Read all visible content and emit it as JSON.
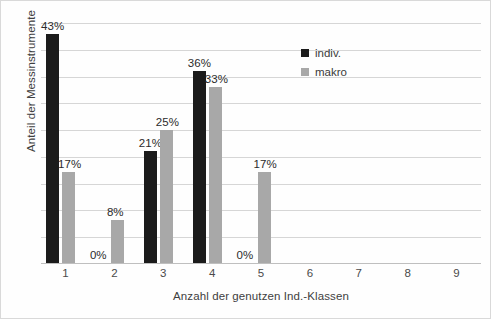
{
  "chart_data": {
    "type": "bar",
    "title": "",
    "xlabel": "Anzahl der genutzen Ind.-Klassen",
    "ylabel": "Anteil der Messinstrumente",
    "categories": [
      "1",
      "2",
      "3",
      "4",
      "5",
      "6",
      "7",
      "8",
      "9"
    ],
    "series": [
      {
        "name": "indiv.",
        "color": "#1b1b1b",
        "values": [
          43,
          0,
          21,
          36,
          0,
          null,
          null,
          null,
          null
        ],
        "labels": [
          "43%",
          "0%",
          "21%",
          "36%",
          "0%",
          "",
          "",
          "",
          ""
        ]
      },
      {
        "name": "makro",
        "color": "#a8a8a8",
        "values": [
          17,
          8,
          25,
          33,
          17,
          null,
          null,
          null,
          null
        ],
        "labels": [
          "17%",
          "8%",
          "25%",
          "33%",
          "17%",
          "",
          "",
          "",
          ""
        ]
      }
    ],
    "ylim": [
      0,
      45
    ],
    "y_tick_interval": 5,
    "y_tick_labels_visible": false,
    "grid": true,
    "legend_position": "top-right-inside",
    "value_label_suffix": "%"
  },
  "axes": {
    "y_title": "Anteil der Messinstrumente",
    "x_title": "Anzahl der genutzen Ind.-Klassen"
  },
  "legend": {
    "items": [
      {
        "label": "indiv.",
        "color": "#1b1b1b"
      },
      {
        "label": "makro",
        "color": "#a8a8a8"
      }
    ]
  },
  "colors": {
    "indiv": "#1b1b1b",
    "makro": "#a8a8a8",
    "gridline": "#d6d6d6",
    "axis": "#bfbfbf",
    "text": "#3f3f3f",
    "background": "#fefefe"
  }
}
